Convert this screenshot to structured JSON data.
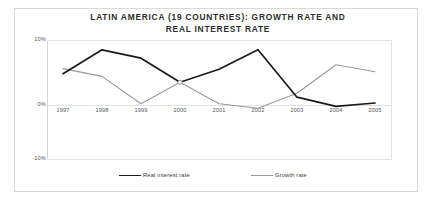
{
  "chart_data": {
    "type": "line",
    "title": "LATIN AMERICA (19 COUNTRIES): GROWTH RATE AND REAL INTEREST RATE",
    "title_line1": "LATIN AMERICA (19 COUNTRIES): GROWTH RATE AND",
    "title_line2": "REAL INTEREST RATE",
    "xlabel": "",
    "ylabel": "",
    "categories": [
      "1997",
      "1998",
      "1999",
      "2000",
      "2001",
      "2002",
      "2003",
      "2004",
      "2005"
    ],
    "ylim": [
      -10,
      10
    ],
    "yticks": [
      10,
      0,
      -10
    ],
    "ytick_labels": [
      "10%",
      "0%",
      "-10%"
    ],
    "grid": true,
    "legend_position": "bottom",
    "series": [
      {
        "name": "Real interest rate",
        "color": "#1a1a1a",
        "values": [
          4.8,
          8.5,
          7.2,
          3.5,
          5.5,
          8.5,
          1.2,
          -0.2,
          0.3
        ]
      },
      {
        "name": "Growth rate",
        "color": "#9a9a9a",
        "values": [
          5.6,
          4.4,
          0.2,
          3.5,
          0.2,
          -0.5,
          1.8,
          6.2,
          5.1
        ]
      }
    ]
  }
}
